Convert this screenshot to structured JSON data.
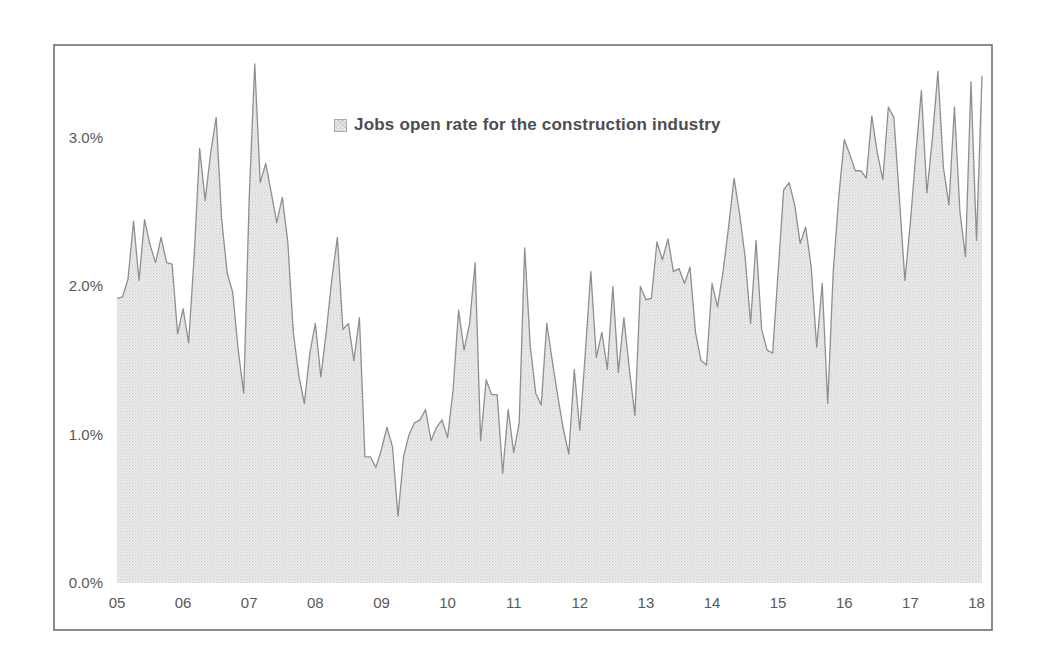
{
  "chart_data": {
    "type": "area",
    "title": "",
    "legend": "Jobs open rate for the construction industry",
    "x_unit": "month",
    "x_range": [
      "2005-01",
      "2018-02"
    ],
    "x_tick_labels": [
      "05",
      "06",
      "07",
      "08",
      "09",
      "10",
      "11",
      "12",
      "13",
      "14",
      "15",
      "16",
      "17",
      "18"
    ],
    "y_ticks": [
      {
        "label": "0.0%",
        "value": 0
      },
      {
        "label": "1.0%",
        "value": 1
      },
      {
        "label": "2.0%",
        "value": 2
      },
      {
        "label": "3.0%",
        "value": 3
      }
    ],
    "ylim": [
      0,
      3.63
    ],
    "grid": false,
    "legend_position": "top-center",
    "series": [
      {
        "name": "Jobs open rate for the construction industry",
        "values": [
          1.92,
          1.93,
          2.05,
          2.44,
          2.04,
          2.45,
          2.28,
          2.16,
          2.33,
          2.16,
          2.15,
          1.68,
          1.85,
          1.62,
          2.2,
          2.93,
          2.58,
          2.9,
          3.14,
          2.45,
          2.09,
          1.96,
          1.57,
          1.28,
          2.6,
          3.5,
          2.7,
          2.83,
          2.63,
          2.43,
          2.6,
          2.3,
          1.69,
          1.4,
          1.21,
          1.55,
          1.75,
          1.39,
          1.7,
          2.05,
          2.33,
          1.71,
          1.75,
          1.5,
          1.79,
          0.85,
          0.85,
          0.78,
          0.9,
          1.05,
          0.92,
          0.45,
          0.85,
          1.0,
          1.08,
          1.1,
          1.17,
          0.96,
          1.05,
          1.1,
          0.98,
          1.3,
          1.84,
          1.57,
          1.75,
          2.16,
          0.96,
          1.37,
          1.27,
          1.27,
          0.74,
          1.17,
          0.88,
          1.08,
          2.26,
          1.6,
          1.28,
          1.2,
          1.75,
          1.5,
          1.26,
          1.04,
          0.87,
          1.44,
          1.03,
          1.55,
          2.1,
          1.52,
          1.69,
          1.44,
          2.0,
          1.42,
          1.79,
          1.44,
          1.13,
          2.0,
          1.91,
          1.92,
          2.3,
          2.18,
          2.32,
          2.1,
          2.12,
          2.02,
          2.13,
          1.69,
          1.5,
          1.47,
          2.02,
          1.86,
          2.1,
          2.4,
          2.73,
          2.49,
          2.2,
          1.75,
          2.31,
          1.71,
          1.57,
          1.55,
          2.1,
          2.65,
          2.7,
          2.55,
          2.29,
          2.4,
          2.13,
          1.59,
          2.02,
          1.21,
          2.1,
          2.6,
          2.99,
          2.89,
          2.78,
          2.78,
          2.73,
          3.15,
          2.9,
          2.72,
          3.21,
          3.14,
          2.6,
          2.04,
          2.43,
          2.9,
          3.32,
          2.63,
          3.0,
          3.45,
          2.8,
          2.55,
          3.21,
          2.5,
          2.2,
          3.38,
          2.31,
          3.42
        ]
      }
    ],
    "colors": {
      "fill_base": "#efefef",
      "fill_dot_dark": "#d0d0d0",
      "fill_dot_light": "#dcdcdc",
      "outline": "#8f8f8f",
      "tick_text": "#595959",
      "legend_text": "#4d4d4d",
      "frame": "#707070"
    }
  }
}
